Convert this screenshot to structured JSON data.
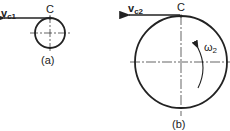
{
  "figure_a": {
    "label": "(a)",
    "point_label": "C",
    "velocity_label": "v",
    "velocity_subscript": "c1"
  },
  "figure_b": {
    "label": "(b)",
    "point_label": "C",
    "velocity_label": "v",
    "velocity_subscript": "c2",
    "angular_label": "ω",
    "angular_subscript": "2"
  },
  "colors": {
    "stroke": "#222222",
    "background": "#ffffff"
  }
}
